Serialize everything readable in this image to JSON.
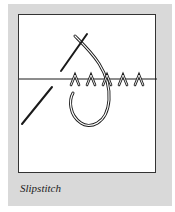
{
  "figure": {
    "caption": "Slipstitch",
    "illustration": "slipstitch-diagram",
    "colors": {
      "plate": "#d9d9d9",
      "frame_border": "#333333",
      "ink": "#1a1a1a"
    }
  }
}
